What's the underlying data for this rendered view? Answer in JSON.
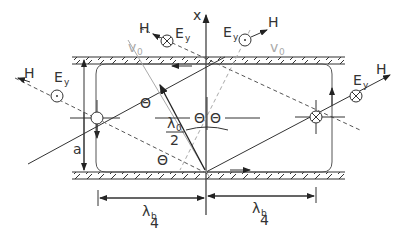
{
  "diagram": {
    "type": "waveguide wave reflection diagram",
    "axis": {
      "label": "x"
    },
    "labels": {
      "H_incident": "H",
      "H_incident_mark": "'",
      "E_incident": "E",
      "E_incident_sub": "y",
      "E_incident_mark": "'",
      "H_reflected": "H",
      "H_reflected_mark": "\"",
      "E_reflected": "E",
      "E_reflected_sub": "y",
      "E_reflected_mark": "\"",
      "v0_left": "v",
      "v0_left_sub": "0",
      "v0_right": "v",
      "v0_right_sub": "0",
      "theta": "Θ",
      "a": "a",
      "lambda0": "λ",
      "lambda0_sub": "0",
      "half_den": "2",
      "lambda_b": "λ",
      "lambda_b_sub": "b",
      "quarter_den": "4"
    },
    "colors": {
      "line": "#333333",
      "gray_line": "#aaaaaa",
      "wall_hatch": "#333333"
    }
  }
}
